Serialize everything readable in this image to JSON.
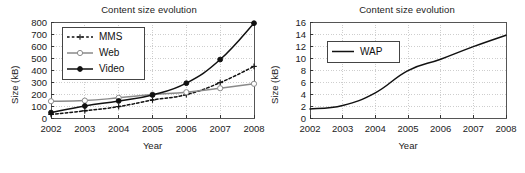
{
  "figure": {
    "background": "#ffffff",
    "panel_count": 2
  },
  "chart_data": [
    {
      "id": "left",
      "type": "line",
      "title": "Content size evolution",
      "xlabel": "Year",
      "ylabel": "Size (kB)",
      "x": [
        2002,
        2003,
        2004,
        2005,
        2006,
        2007,
        2008
      ],
      "xtick_labels": [
        "2002",
        "2003",
        "2004",
        "2005",
        "2006",
        "2007",
        "2008"
      ],
      "ytick_labels": [
        "0",
        "100",
        "200",
        "300",
        "400",
        "500",
        "600",
        "700",
        "800"
      ],
      "ylim": [
        0,
        800
      ],
      "xlim": [
        2002,
        2008
      ],
      "ytick_step": 100,
      "grid": true,
      "grid_style": "dotted",
      "legend_position": "upper-left",
      "series": [
        {
          "name": "MMS",
          "values": [
            30,
            60,
            95,
            150,
            195,
            295,
            430
          ],
          "color": "#111111",
          "line_style": "dashed",
          "marker": "plus"
        },
        {
          "name": "Web",
          "values": [
            140,
            145,
            168,
            195,
            215,
            248,
            285
          ],
          "color": "#8a8a8a",
          "line_style": "solid",
          "marker": "open-circle"
        },
        {
          "name": "Video",
          "values": [
            45,
            100,
            142,
            192,
            290,
            487,
            790
          ],
          "color": "#111111",
          "line_style": "solid",
          "marker": "filled-diamond"
        }
      ]
    },
    {
      "id": "right",
      "type": "line",
      "title": "Content size evolution",
      "xlabel": "Year",
      "ylabel": "Size (kB)",
      "x": [
        2002,
        2003,
        2004,
        2005,
        2006,
        2007,
        2008
      ],
      "xtick_labels": [
        "2002",
        "2003",
        "2004",
        "2005",
        "2006",
        "2007",
        "2008"
      ],
      "ytick_labels": [
        "0",
        "2",
        "4",
        "6",
        "8",
        "10",
        "12",
        "14",
        "16"
      ],
      "ylim": [
        0,
        16
      ],
      "xlim": [
        2002,
        2008
      ],
      "ytick_step": 2,
      "grid": true,
      "grid_style": "dotted",
      "legend_position": "upper-left",
      "series": [
        {
          "name": "WAP",
          "values": [
            1.5,
            2.1,
            4.2,
            7.9,
            9.8,
            11.9,
            13.8
          ],
          "color": "#111111",
          "line_style": "solid",
          "marker": "none"
        }
      ]
    }
  ]
}
